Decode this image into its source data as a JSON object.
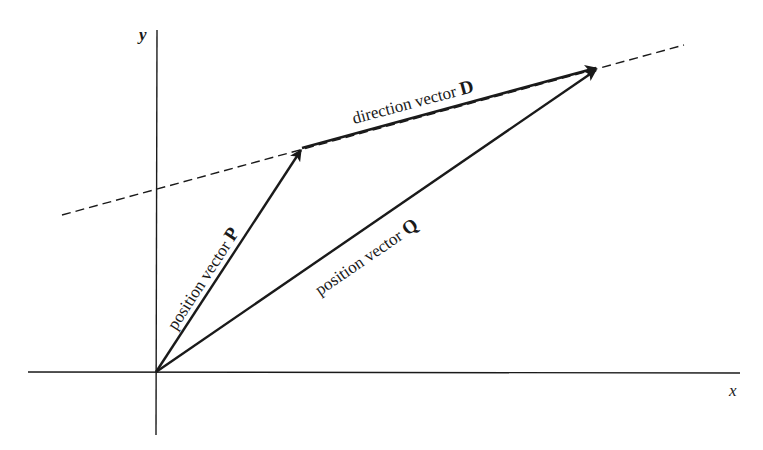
{
  "diagram": {
    "axes": {
      "x_label": "x",
      "y_label": "y"
    },
    "vectors": {
      "P": {
        "prefix": "position vector ",
        "symbol": "P"
      },
      "Q": {
        "prefix": "position vector ",
        "symbol": "Q"
      },
      "D": {
        "prefix": "direction vector ",
        "symbol": "D"
      }
    },
    "colors": {
      "ink": "#1a1a1a",
      "background": "#ffffff"
    }
  }
}
